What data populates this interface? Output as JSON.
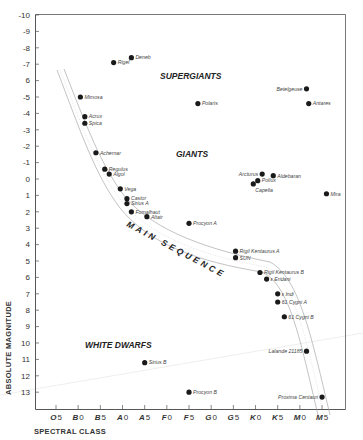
{
  "chart_data": {
    "type": "scatter",
    "title": "",
    "xlabel": "SPECTRAL CLASS",
    "ylabel": "ABSOLUTE MAGNITUDE",
    "categories": [
      "O5",
      "B0",
      "B5",
      "A0",
      "A5",
      "F0",
      "F5",
      "G0",
      "G5",
      "K0",
      "K5",
      "M0",
      "M5"
    ],
    "category_letters": [
      "O",
      "B",
      "B",
      "A",
      "A",
      "F",
      "F",
      "G",
      "G",
      "K",
      "K",
      "M",
      "M"
    ],
    "category_numbers": [
      "5",
      "0",
      "5",
      "0",
      "5",
      "0",
      "5",
      "0",
      "5",
      "0",
      "5",
      "0",
      "5"
    ],
    "yticks": [
      -10,
      -9,
      -8,
      -7,
      -6,
      -5,
      -4,
      -3,
      -2,
      -1,
      0,
      1,
      2,
      3,
      4,
      5,
      6,
      7,
      8,
      9,
      10,
      11,
      12,
      13
    ],
    "ytick_labels": [
      "-10",
      "-9",
      "-8",
      "-7",
      "6",
      "-5",
      "-4",
      "-3",
      "-2",
      "-1",
      "0",
      "1",
      "2",
      "3",
      "4",
      "5",
      "6",
      "7",
      "8",
      "9",
      "10",
      "11",
      "12",
      "13"
    ],
    "ylim": [
      -10,
      14
    ],
    "y_inverted": true,
    "grid": false,
    "regions": [
      {
        "name": "SUPERGIANTS",
        "x": "F5",
        "y": -6.3
      },
      {
        "name": "GIANTS",
        "x": "F5",
        "y": -1.5
      },
      {
        "name": "WHITE DWARFS",
        "x": "A0",
        "y": 10.2
      },
      {
        "name": "MAIN SEQUENCE",
        "x": "A5-G0",
        "y": 3.5
      }
    ],
    "stars": [
      {
        "name": "Deneb",
        "spectral": "A2",
        "x_index": 3.4,
        "mag": -7.4,
        "label_side": "right"
      },
      {
        "name": "Rigel",
        "spectral": "B8",
        "x_index": 2.6,
        "mag": -7.1,
        "label_side": "right"
      },
      {
        "name": "Mimosa",
        "spectral": "B0.5",
        "x_index": 1.1,
        "mag": -5.0,
        "label_side": "right"
      },
      {
        "name": "Acrux",
        "spectral": "B1",
        "x_index": 1.3,
        "mag": -3.8,
        "label_side": "right"
      },
      {
        "name": "Spica",
        "spectral": "B1",
        "x_index": 1.3,
        "mag": -3.4,
        "label_side": "right"
      },
      {
        "name": "Achernar",
        "spectral": "B3",
        "x_index": 1.8,
        "mag": -1.6,
        "label_side": "right"
      },
      {
        "name": "Regulus",
        "spectral": "B7",
        "x_index": 2.2,
        "mag": -0.6,
        "label_side": "right"
      },
      {
        "name": "Algol",
        "spectral": "B8",
        "x_index": 2.4,
        "mag": -0.3,
        "label_side": "right"
      },
      {
        "name": "Vega",
        "spectral": "A0",
        "x_index": 2.9,
        "mag": 0.6,
        "label_side": "right"
      },
      {
        "name": "Castor",
        "spectral": "A1",
        "x_index": 3.2,
        "mag": 1.2,
        "label_side": "right"
      },
      {
        "name": "Sirius A",
        "spectral": "A1",
        "x_index": 3.2,
        "mag": 1.5,
        "label_side": "right"
      },
      {
        "name": "Fomalhaut",
        "spectral": "A3",
        "x_index": 3.4,
        "mag": 2.0,
        "label_side": "right"
      },
      {
        "name": "Altair",
        "spectral": "A7",
        "x_index": 4.1,
        "mag": 2.3,
        "label_side": "right"
      },
      {
        "name": "Procyon A",
        "spectral": "F5",
        "x_index": 6.0,
        "mag": 2.7,
        "label_side": "right"
      },
      {
        "name": "Polaris",
        "spectral": "F8",
        "x_index": 6.4,
        "mag": -4.6,
        "label_side": "right"
      },
      {
        "name": "Rigil Kentaurus A",
        "spectral": "G2",
        "x_index": 8.1,
        "mag": 4.4,
        "label_side": "right"
      },
      {
        "name": "SUN",
        "spectral": "G2",
        "x_index": 8.1,
        "mag": 4.8,
        "label_side": "right"
      },
      {
        "name": "Rigil Kentaurus B",
        "spectral": "K1",
        "x_index": 9.2,
        "mag": 5.7,
        "label_side": "right"
      },
      {
        "name": "ε Eridani",
        "spectral": "K2",
        "x_index": 9.5,
        "mag": 6.1,
        "label_side": "right"
      },
      {
        "name": "ε Indi",
        "spectral": "K5",
        "x_index": 10.0,
        "mag": 7.0,
        "label_side": "right"
      },
      {
        "name": "61 Cygni A",
        "spectral": "K5",
        "x_index": 10.0,
        "mag": 7.5,
        "label_side": "right"
      },
      {
        "name": "61 Cygni B",
        "spectral": "K7",
        "x_index": 10.3,
        "mag": 8.4,
        "label_side": "right"
      },
      {
        "name": "Lalande 21185",
        "spectral": "M2",
        "x_index": 11.3,
        "mag": 10.5,
        "label_side": "left"
      },
      {
        "name": "Proxima Centauri",
        "spectral": "M5",
        "x_index": 12.0,
        "mag": 13.3,
        "label_side": "left"
      },
      {
        "name": "Sirius B",
        "spectral": "A5",
        "x_index": 4.0,
        "mag": 11.2,
        "label_side": "right"
      },
      {
        "name": "Procyon B",
        "spectral": "F5",
        "x_index": 6.0,
        "mag": 13.0,
        "label_side": "right"
      },
      {
        "name": "Arcturus",
        "spectral": "K1",
        "x_index": 9.3,
        "mag": -0.3,
        "label_side": "left"
      },
      {
        "name": "Aldebaran",
        "spectral": "K5",
        "x_index": 9.8,
        "mag": -0.2,
        "label_side": "right"
      },
      {
        "name": "Pollux",
        "spectral": "K0",
        "x_index": 9.1,
        "mag": 0.1,
        "label_side": "right"
      },
      {
        "name": "Capella",
        "spectral": "G8",
        "x_index": 8.9,
        "mag": 0.3,
        "label_side": "below"
      },
      {
        "name": "Mira",
        "spectral": "M7",
        "x_index": 12.2,
        "mag": 0.9,
        "label_side": "right"
      },
      {
        "name": "Betelgeuse",
        "spectral": "M2",
        "x_index": 11.3,
        "mag": -5.5,
        "label_side": "left"
      },
      {
        "name": "Antares",
        "spectral": "M1",
        "x_index": 11.4,
        "mag": -4.6,
        "label_side": "right"
      }
    ],
    "main_sequence_band": "dotted-edged band running from upper-left (B0, mag -6) to lower-right (M5, mag 13.5)"
  },
  "ui": {
    "ink_color": "#1a1a1a",
    "band_color": "#8a8a8a",
    "axis_color": "#444444"
  }
}
